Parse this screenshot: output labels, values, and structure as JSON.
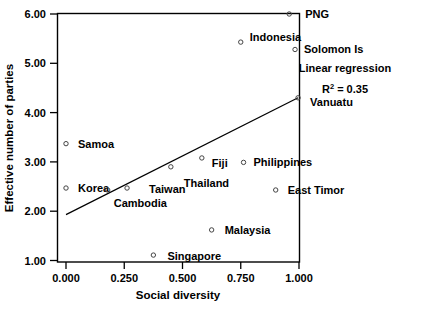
{
  "chart_data": {
    "type": "scatter",
    "title": "",
    "xlabel": "Social diversity",
    "ylabel": "Effective number of parties",
    "xlim": [
      0.0,
      1.0
    ],
    "ylim": [
      1.0,
      6.0
    ],
    "xticks": [
      "0.000",
      "0.250",
      "0.500",
      "0.750",
      "1.000"
    ],
    "xtick_values": [
      0.0,
      0.25,
      0.5,
      0.75,
      1.0
    ],
    "yticks": [
      "1.00",
      "2.00",
      "3.00",
      "4.00",
      "5.00",
      "6.00"
    ],
    "ytick_values": [
      1.0,
      2.0,
      3.0,
      4.0,
      5.0,
      6.0
    ],
    "grid": false,
    "legend_position": "upper-right-outside",
    "points": [
      {
        "label": "PNG",
        "x": 0.958,
        "y": 6.0,
        "label_dx": 16,
        "label_dy": 4
      },
      {
        "label": "Indonesia",
        "x": 0.75,
        "y": 5.43,
        "label_dx": 9,
        "label_dy": -1
      },
      {
        "label": "Solomon Is",
        "x": 0.983,
        "y": 5.28,
        "label_dx": 9,
        "label_dy": 4
      },
      {
        "label": "Vanuatu",
        "x": 0.996,
        "y": 4.3,
        "label_dx": 12,
        "label_dy": 8
      },
      {
        "label": "Samoa",
        "x": 0.0,
        "y": 3.37,
        "label_dx": 12,
        "label_dy": 4
      },
      {
        "label": "Fiji",
        "x": 0.583,
        "y": 3.08,
        "label_dx": 10,
        "label_dy": 9
      },
      {
        "label": "Thailand",
        "x": 0.45,
        "y": 2.9,
        "label_dx": 13,
        "label_dy": 20
      },
      {
        "label": "Philippines",
        "x": 0.762,
        "y": 2.99,
        "label_dx": 10,
        "label_dy": 4
      },
      {
        "label": "Korea",
        "x": 0.0,
        "y": 2.47,
        "label_dx": 12,
        "label_dy": 4
      },
      {
        "label": "Cambodia",
        "x": 0.179,
        "y": 2.43,
        "label_dx": 6,
        "label_dy": 17
      },
      {
        "label": "Taiwan",
        "x": 0.262,
        "y": 2.47,
        "label_dx": 22,
        "label_dy": 5
      },
      {
        "label": "East Timor",
        "x": 0.9,
        "y": 2.43,
        "label_dx": 12,
        "label_dy": 4
      },
      {
        "label": "Malaysia",
        "x": 0.625,
        "y": 1.62,
        "label_dx": 13,
        "label_dy": 4
      },
      {
        "label": "Singapore",
        "x": 0.375,
        "y": 1.11,
        "label_dx": 14,
        "label_dy": 5
      }
    ],
    "regression": {
      "label": "Linear regression",
      "r2_label": "R",
      "r2_sup": "2",
      "r2_value": "= 0.35",
      "x_start": 0.0,
      "y_start": 1.93,
      "x_end": 0.996,
      "y_end": 4.3
    }
  }
}
